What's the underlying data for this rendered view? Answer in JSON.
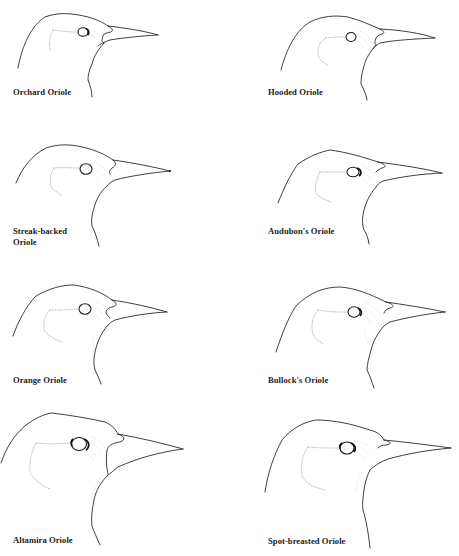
{
  "plate": {
    "background": "#ffffff",
    "line_color": "#2a2a2a",
    "birds": [
      {
        "label": "Orchard Oriole",
        "column": "left",
        "row": 1
      },
      {
        "label": "Hooded Oriole",
        "column": "right",
        "row": 1
      },
      {
        "label_line1": "Streak-backed",
        "label_line2": "Oriole",
        "column": "left",
        "row": 2
      },
      {
        "label": "Audubon's Oriole",
        "column": "right",
        "row": 2
      },
      {
        "label": "Orange Oriole",
        "column": "left",
        "row": 3
      },
      {
        "label": "Bullock's Oriole",
        "column": "right",
        "row": 3
      },
      {
        "label": "Altamira Oriole",
        "column": "left",
        "row": 4
      },
      {
        "label": "Spot-breasted Oriole",
        "column": "right",
        "row": 4
      }
    ]
  }
}
